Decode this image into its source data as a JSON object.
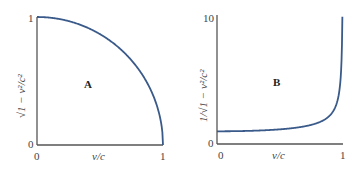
{
  "chart_data": [
    {
      "type": "line",
      "panel_label": "A",
      "title": "",
      "xlabel": "v/c",
      "ylabel": "√(1 − v²/c²)",
      "xlim": [
        0,
        1
      ],
      "ylim": [
        0,
        1
      ],
      "x_ticks": [
        "0",
        "1"
      ],
      "y_ticks": [
        "0",
        "1"
      ],
      "grid": false,
      "series": [
        {
          "name": "sqrt(1 - v^2/c^2)",
          "color": "#3a5a8a",
          "x": [
            0,
            0.1,
            0.2,
            0.3,
            0.4,
            0.5,
            0.6,
            0.7,
            0.8,
            0.9,
            0.95,
            0.99,
            1.0
          ],
          "values": [
            1.0,
            0.995,
            0.98,
            0.954,
            0.917,
            0.866,
            0.8,
            0.714,
            0.6,
            0.436,
            0.312,
            0.141,
            0.0
          ]
        }
      ]
    },
    {
      "type": "line",
      "panel_label": "B",
      "title": "",
      "xlabel": "v/c",
      "ylabel": "1/√(1 − v²/c²)",
      "xlim": [
        0,
        1
      ],
      "ylim": [
        0,
        10
      ],
      "x_ticks": [
        "0",
        "1"
      ],
      "y_ticks": [
        "0",
        "10"
      ],
      "grid": false,
      "series": [
        {
          "name": "1/sqrt(1 - v^2/c^2)",
          "color": "#3a5a8a",
          "x": [
            0,
            0.1,
            0.2,
            0.3,
            0.4,
            0.5,
            0.6,
            0.7,
            0.8,
            0.9,
            0.95,
            0.98,
            0.99,
            0.995
          ],
          "values": [
            1.0,
            1.005,
            1.021,
            1.048,
            1.091,
            1.155,
            1.25,
            1.4,
            1.667,
            2.294,
            3.203,
            5.025,
            7.089,
            10.0
          ]
        }
      ]
    }
  ],
  "panels": {
    "a": {
      "label": "A",
      "x0": "0",
      "x1": "1",
      "y0": "0",
      "y1": "1",
      "xlabel": "v/c",
      "ylabel": "√1 − v²/c²"
    },
    "b": {
      "label": "B",
      "x0": "0",
      "x1": "1",
      "y0": "0",
      "y1": "10",
      "xlabel": "v/c",
      "ylabel": "1/√1 − v²/c²"
    }
  }
}
